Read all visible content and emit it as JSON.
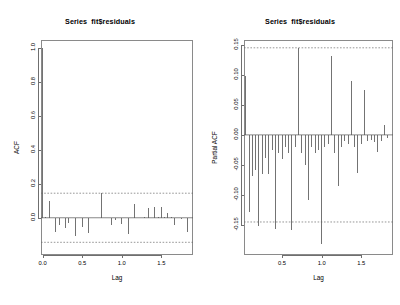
{
  "figure": {
    "background": "#ffffff",
    "axis_color": "#6f6f6f",
    "bar_color": "#5a5a5a",
    "conf_color": "#6a6a6a",
    "zero_line_color": "#555555"
  },
  "panels": [
    {
      "id": "acf",
      "title": "Series  fit$residuals"
    },
    {
      "id": "pacf",
      "title": "Series  fit$residuals"
    }
  ],
  "chart_data": [
    {
      "type": "bar",
      "id": "acf",
      "title": "Series  fit$residuals",
      "xlabel": "Lag",
      "ylabel": "ACF",
      "xlim": [
        -0.02,
        1.9
      ],
      "ylim": [
        -0.22,
        1.05
      ],
      "xticks": [
        0.0,
        0.5,
        1.0,
        1.5
      ],
      "xticklabels": [
        "0.0",
        "0.5",
        "1.0",
        "1.5"
      ],
      "yticks": [
        0.0,
        0.2,
        0.4,
        0.6,
        0.8,
        1.0
      ],
      "yticklabels": [
        "0.0",
        "0.2",
        "0.4",
        "0.6",
        "0.8",
        "1.0"
      ],
      "grid": false,
      "zero_line": 0.0,
      "conf_level": 0.95,
      "conf_bounds": [
        0.145,
        -0.145
      ],
      "lag_step": 0.0417,
      "x": [
        0.0,
        0.0417,
        0.0833,
        0.125,
        0.1667,
        0.2083,
        0.25,
        0.2917,
        0.3333,
        0.375,
        0.4167,
        0.4583,
        0.5,
        0.5417,
        0.5833,
        0.625,
        0.6667,
        0.7083,
        0.75,
        0.7917,
        0.8333,
        0.875,
        0.9167,
        0.9583,
        1.0,
        1.0417,
        1.0833,
        1.125,
        1.1667,
        1.2083,
        1.25,
        1.2917,
        1.3333,
        1.375,
        1.4167,
        1.4583,
        1.5,
        1.5417,
        1.5833,
        1.625,
        1.6667,
        1.7083,
        1.75,
        1.7917,
        1.8333
      ],
      "values": [
        1.0,
        0.004,
        0.098,
        -0.004,
        -0.085,
        -0.042,
        -0.003,
        -0.062,
        -0.032,
        -0.002,
        -0.108,
        -0.004,
        -0.052,
        -0.003,
        -0.092,
        -0.002,
        -0.004,
        -0.003,
        0.144,
        -0.003,
        -0.002,
        -0.045,
        -0.015,
        -0.003,
        -0.035,
        -0.002,
        -0.095,
        -0.003,
        0.082,
        -0.002,
        -0.003,
        0.004,
        0.055,
        -0.002,
        0.061,
        0.003,
        0.062,
        0.004,
        0.03,
        0.003,
        -0.045,
        -0.004,
        -0.008,
        -0.003,
        -0.085
      ]
    },
    {
      "type": "bar",
      "id": "pacf",
      "title": "Series  fit$residuals",
      "xlabel": "Lag",
      "ylabel": "Partial ACF",
      "xlim": [
        0.02,
        1.9
      ],
      "ylim": [
        -0.2,
        0.158
      ],
      "xticks": [
        0.5,
        1.0,
        1.5
      ],
      "xticklabels": [
        "0.5",
        "1.0",
        "1.5"
      ],
      "yticks": [
        -0.15,
        -0.1,
        -0.05,
        0.0,
        0.05,
        0.1,
        0.15
      ],
      "yticklabels": [
        "-0.15",
        "-0.10",
        "-0.05",
        "0.00",
        "0.05",
        "0.10",
        "0.15"
      ],
      "grid": false,
      "zero_line": 0.0,
      "conf_level": 0.95,
      "conf_bounds": [
        0.145,
        -0.145
      ],
      "lag_step": 0.0417,
      "x": [
        0.0417,
        0.0833,
        0.125,
        0.1667,
        0.2083,
        0.25,
        0.2917,
        0.3333,
        0.375,
        0.4167,
        0.4583,
        0.5,
        0.5417,
        0.5833,
        0.625,
        0.6667,
        0.7083,
        0.75,
        0.7917,
        0.8333,
        0.875,
        0.9167,
        0.9583,
        1.0,
        1.0417,
        1.0833,
        1.125,
        1.1667,
        1.2083,
        1.25,
        1.2917,
        1.3333,
        1.375,
        1.4167,
        1.4583,
        1.5,
        1.5417,
        1.5833,
        1.625,
        1.6667,
        1.7083,
        1.75,
        1.7917,
        1.8333
      ],
      "values": [
        0.098,
        -0.128,
        -0.068,
        -0.058,
        -0.151,
        -0.065,
        -0.038,
        -0.065,
        -0.025,
        -0.156,
        -0.03,
        -0.04,
        -0.02,
        -0.03,
        -0.158,
        -0.02,
        0.144,
        -0.03,
        -0.05,
        -0.108,
        -0.02,
        -0.03,
        -0.025,
        -0.182,
        -0.02,
        -0.015,
        0.131,
        -0.03,
        -0.085,
        -0.02,
        -0.01,
        -0.015,
        0.09,
        -0.02,
        -0.063,
        -0.015,
        0.074,
        -0.01,
        -0.008,
        -0.012,
        -0.028,
        -0.01,
        0.017,
        -0.005
      ]
    }
  ]
}
